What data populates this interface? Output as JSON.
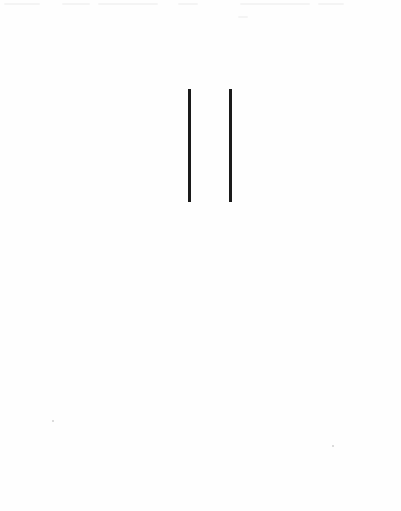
{
  "page": {
    "type": "scanned-page",
    "background_color": "#fefefe"
  },
  "figure": {
    "rules": [
      {
        "name": "left-vertical-rule",
        "x": 188,
        "y": 89,
        "width": 3,
        "height": 113,
        "color": "#1a1a1a"
      },
      {
        "name": "right-vertical-rule",
        "x": 229,
        "y": 89,
        "width": 3,
        "height": 113,
        "color": "#1a1a1a"
      }
    ]
  }
}
